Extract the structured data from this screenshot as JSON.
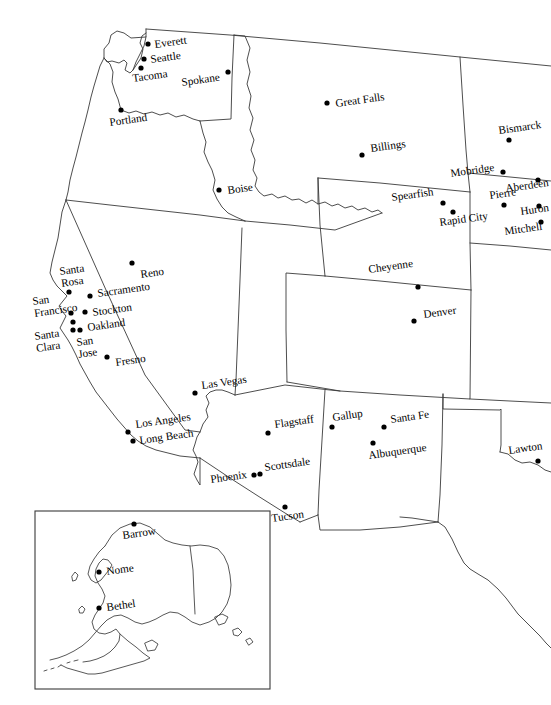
{
  "map": {
    "title": "Western United States City Map",
    "projection_note": "conic",
    "background_color": "#ffffff",
    "line_color": "#3a3a3a",
    "marker_color": "#000000",
    "label_rotation_deg": -8,
    "cities": [
      {
        "name": "Everett",
        "dot_x": 148,
        "dot_y": 44,
        "label_x": 155,
        "label_y": 48,
        "anchor": "start"
      },
      {
        "name": "Seattle",
        "dot_x": 144,
        "dot_y": 59,
        "label_x": 151,
        "label_y": 63,
        "anchor": "start"
      },
      {
        "name": "Tacoma",
        "dot_x": 141,
        "dot_y": 68,
        "label_x": 133,
        "label_y": 82,
        "anchor": "start"
      },
      {
        "name": "Spokane",
        "dot_x": 228,
        "dot_y": 72,
        "label_x": 182,
        "label_y": 86,
        "anchor": "start"
      },
      {
        "name": "Portland",
        "dot_x": 121,
        "dot_y": 110,
        "label_x": 110,
        "label_y": 126,
        "anchor": "start"
      },
      {
        "name": "Great Falls",
        "dot_x": 327,
        "dot_y": 103,
        "label_x": 336,
        "label_y": 107,
        "anchor": "start"
      },
      {
        "name": "Bismarck",
        "dot_x": 509,
        "dot_y": 140,
        "label_x": 499,
        "label_y": 134,
        "anchor": "start"
      },
      {
        "name": "Billings",
        "dot_x": 362,
        "dot_y": 155,
        "label_x": 371,
        "label_y": 152,
        "anchor": "start"
      },
      {
        "name": "Mobridge",
        "dot_x": 503,
        "dot_y": 172,
        "label_x": 451,
        "label_y": 177,
        "anchor": "start"
      },
      {
        "name": "Aberdeen",
        "dot_x": 538,
        "dot_y": 180,
        "label_x": 506,
        "label_y": 192,
        "anchor": "start"
      },
      {
        "name": "Spearfish",
        "dot_x": 443,
        "dot_y": 203,
        "label_x": 392,
        "label_y": 201,
        "anchor": "start"
      },
      {
        "name": "Pierre",
        "dot_x": 504,
        "dot_y": 205,
        "label_x": 490,
        "label_y": 199,
        "anchor": "start"
      },
      {
        "name": "Huron",
        "dot_x": 539,
        "dot_y": 206,
        "label_x": 521,
        "label_y": 215,
        "anchor": "start"
      },
      {
        "name": "Rapid City",
        "dot_x": 453,
        "dot_y": 212,
        "label_x": 440,
        "label_y": 226,
        "anchor": "start"
      },
      {
        "name": "Mitchell",
        "dot_x": 541,
        "dot_y": 222,
        "label_x": 505,
        "label_y": 235,
        "anchor": "start"
      },
      {
        "name": "Boise",
        "dot_x": 219,
        "dot_y": 190,
        "label_x": 228,
        "label_y": 194,
        "anchor": "start"
      },
      {
        "name": "Reno",
        "dot_x": 132,
        "dot_y": 263,
        "label_x": 141,
        "label_y": 278,
        "anchor": "start"
      },
      {
        "name": "Cheyenne",
        "dot_x": 418,
        "dot_y": 287,
        "label_x": 369,
        "label_y": 273,
        "anchor": "start"
      },
      {
        "name": "Denver",
        "dot_x": 414,
        "dot_y": 321,
        "label_x": 424,
        "label_y": 318,
        "anchor": "start"
      },
      {
        "name": "Santa Rosa",
        "dot_x": 69,
        "dot_y": 292,
        "label_x": 60,
        "label_y": 275,
        "anchor": "start",
        "lines": [
          "Santa",
          "Rosa"
        ]
      },
      {
        "name": "Sacramento",
        "dot_x": 90,
        "dot_y": 296,
        "label_x": 98,
        "label_y": 297,
        "anchor": "start"
      },
      {
        "name": "San Francisco",
        "dot_x": 71,
        "dot_y": 313,
        "label_x": 33,
        "label_y": 305,
        "anchor": "start",
        "lines": [
          "San",
          "Francisco"
        ]
      },
      {
        "name": "Stockton",
        "dot_x": 85,
        "dot_y": 312,
        "label_x": 93,
        "label_y": 316,
        "anchor": "start"
      },
      {
        "name": "Oakland",
        "dot_x": 73,
        "dot_y": 322,
        "label_x": 88,
        "label_y": 331,
        "anchor": "start"
      },
      {
        "name": "Santa Clara",
        "dot_x": 73,
        "dot_y": 330,
        "label_x": 35,
        "label_y": 340,
        "anchor": "start",
        "lines": [
          "Santa",
          "Clara"
        ]
      },
      {
        "name": "San Jose",
        "dot_x": 80,
        "dot_y": 330,
        "label_x": 77,
        "label_y": 346,
        "anchor": "start",
        "lines": [
          "San",
          "Jose"
        ]
      },
      {
        "name": "Fresno",
        "dot_x": 107,
        "dot_y": 357,
        "label_x": 116,
        "label_y": 366,
        "anchor": "start"
      },
      {
        "name": "Las Vegas",
        "dot_x": 195,
        "dot_y": 393,
        "label_x": 202,
        "label_y": 389,
        "anchor": "start"
      },
      {
        "name": "Los Angeles",
        "dot_x": 128,
        "dot_y": 432,
        "label_x": 136,
        "label_y": 428,
        "anchor": "start"
      },
      {
        "name": "Long Beach",
        "dot_x": 133,
        "dot_y": 441,
        "label_x": 140,
        "label_y": 444,
        "anchor": "start"
      },
      {
        "name": "Flagstaff",
        "dot_x": 268,
        "dot_y": 433,
        "label_x": 275,
        "label_y": 428,
        "anchor": "start"
      },
      {
        "name": "Gallup",
        "dot_x": 332,
        "dot_y": 427,
        "label_x": 333,
        "label_y": 421,
        "anchor": "start"
      },
      {
        "name": "Santa Fe",
        "dot_x": 384,
        "dot_y": 427,
        "label_x": 391,
        "label_y": 423,
        "anchor": "start"
      },
      {
        "name": "Albuquerque",
        "dot_x": 373,
        "dot_y": 443,
        "label_x": 369,
        "label_y": 459,
        "anchor": "start"
      },
      {
        "name": "Scottsdale",
        "dot_x": 260,
        "dot_y": 474,
        "label_x": 265,
        "label_y": 471,
        "anchor": "start"
      },
      {
        "name": "Phoenix",
        "dot_x": 254,
        "dot_y": 475,
        "label_x": 211,
        "label_y": 483,
        "anchor": "start"
      },
      {
        "name": "Tucson",
        "dot_x": 285,
        "dot_y": 507,
        "label_x": 272,
        "label_y": 522,
        "anchor": "start"
      },
      {
        "name": "Lawton",
        "dot_x": 538,
        "dot_y": 461,
        "label_x": 509,
        "label_y": 454,
        "anchor": "start"
      }
    ],
    "inset": {
      "name": "Alaska",
      "frame": {
        "x": 35,
        "y": 511,
        "width": 235,
        "height": 178
      },
      "cities": [
        {
          "name": "Barrow",
          "dot_x": 134,
          "dot_y": 524,
          "label_x": 123,
          "label_y": 539,
          "anchor": "start"
        },
        {
          "name": "Nome",
          "dot_x": 99,
          "dot_y": 572,
          "label_x": 107,
          "label_y": 575,
          "anchor": "start"
        },
        {
          "name": "Bethel",
          "dot_x": 99,
          "dot_y": 608,
          "label_x": 107,
          "label_y": 611,
          "anchor": "start"
        }
      ]
    }
  }
}
